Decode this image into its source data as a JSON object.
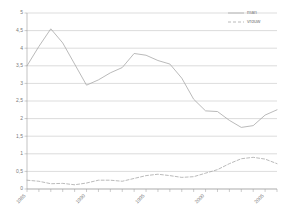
{
  "chart_data": {
    "type": "line",
    "title": "",
    "subtitle": "",
    "xlabel": "",
    "ylabel": "",
    "xlim": [
      1985,
      2006
    ],
    "ylim": [
      0,
      5
    ],
    "yticks": [
      "0",
      "0,5",
      "1",
      "1,5",
      "2",
      "2,5",
      "3",
      "3,5",
      "4",
      "4,5",
      "5"
    ],
    "ytick_values": [
      0,
      0.5,
      1,
      1.5,
      2,
      2.5,
      3,
      3.5,
      4,
      4.5,
      5
    ],
    "xticks_labeled": [
      "1985",
      "1990",
      "1995",
      "2000",
      "2005"
    ],
    "xtick_values": [
      1985,
      1990,
      1995,
      2000,
      2005
    ],
    "x": [
      1985,
      1986,
      1987,
      1988,
      1989,
      1990,
      1991,
      1992,
      1993,
      1994,
      1995,
      1996,
      1997,
      1998,
      1999,
      2000,
      2001,
      2002,
      2003,
      2004,
      2005,
      2006
    ],
    "grid": "horizontal",
    "legend_position": "top-right",
    "series": [
      {
        "name": "man",
        "style": "solid",
        "color": "#a8a8a8",
        "values": [
          3.5,
          4.05,
          4.55,
          4.15,
          3.55,
          2.95,
          3.1,
          3.3,
          3.45,
          3.85,
          3.8,
          3.65,
          3.55,
          3.15,
          2.55,
          2.22,
          2.2,
          1.95,
          1.75,
          1.8,
          2.1,
          2.25
        ]
      },
      {
        "name": "vrouw",
        "style": "dashed",
        "color": "#a8a8a8",
        "values": [
          0.25,
          0.22,
          0.15,
          0.16,
          0.12,
          0.17,
          0.25,
          0.25,
          0.22,
          0.3,
          0.38,
          0.42,
          0.38,
          0.33,
          0.35,
          0.45,
          0.55,
          0.72,
          0.86,
          0.9,
          0.85,
          0.72
        ]
      }
    ]
  },
  "legend": {
    "items": [
      {
        "label": "man",
        "style": "solid"
      },
      {
        "label": "vrouw",
        "style": "dashed"
      }
    ]
  }
}
